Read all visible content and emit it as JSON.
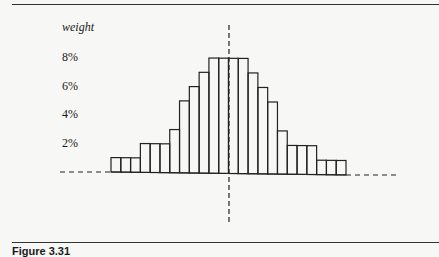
{
  "figure": {
    "caption": "Figure 3.31",
    "ylabel": "weight"
  },
  "chart_data": {
    "type": "bar",
    "title": "",
    "xlabel": "",
    "ylabel": "weight",
    "yticks": [
      "2%",
      "4%",
      "6%",
      "8%"
    ],
    "ylim": [
      0,
      9
    ],
    "unit": "%",
    "categories": [
      "1",
      "2",
      "3",
      "4",
      "5",
      "6",
      "7",
      "8",
      "9",
      "10",
      "11",
      "12",
      "13",
      "14",
      "15",
      "16",
      "17",
      "18",
      "19",
      "20",
      "21",
      "22",
      "23",
      "24"
    ],
    "values": [
      1,
      1,
      1,
      2,
      2,
      2,
      3,
      5,
      6,
      7,
      8,
      8,
      8,
      8,
      7,
      6,
      5,
      3,
      2,
      2,
      2,
      1,
      1,
      1
    ],
    "annotations": [
      "dashed vertical center line",
      "dashed baseline extensions left and right"
    ],
    "grid": false,
    "legend": null
  }
}
